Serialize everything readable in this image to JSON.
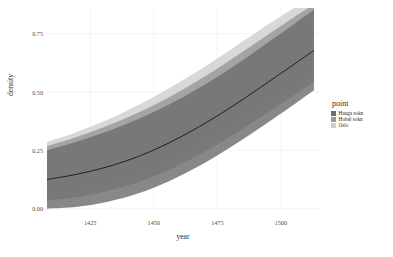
{
  "chart_data": {
    "type": "area",
    "title": "",
    "xlabel": "year",
    "ylabel": "density",
    "xlim": [
      1408,
      1515
    ],
    "ylim": [
      -0.01,
      0.86
    ],
    "xticks": [
      1425,
      1450,
      1475,
      1500
    ],
    "xtick_labels": [
      "1425",
      "1450",
      "1475",
      "1500"
    ],
    "yticks": [
      0.0,
      0.25,
      0.5,
      0.75
    ],
    "ytick_labels": [
      "0.00",
      "0.25",
      "0.50",
      "0.75"
    ],
    "grid": true,
    "grid_color": "#f2f2f2",
    "panel_background": "#ffffff",
    "legend_position": "right",
    "legend_title": "point",
    "series": [
      {
        "name": "Hauga sokn",
        "color": "#6e6e6e",
        "kind": "ribbon-with-median",
        "x": [
          1408,
          1420,
          1432,
          1444,
          1456,
          1468,
          1480,
          1492,
          1504,
          1513
        ],
        "median": [
          0.125,
          0.148,
          0.18,
          0.224,
          0.282,
          0.352,
          0.432,
          0.52,
          0.61,
          0.678
        ],
        "lower": [
          0.0,
          0.008,
          0.03,
          0.066,
          0.118,
          0.184,
          0.262,
          0.348,
          0.438,
          0.508
        ],
        "upper": [
          0.25,
          0.288,
          0.332,
          0.384,
          0.446,
          0.518,
          0.6,
          0.69,
          0.782,
          0.852
        ]
      },
      {
        "name": "Hobøl sokn",
        "color": "#999999",
        "kind": "ribbon",
        "x": [
          1408,
          1420,
          1432,
          1444,
          1456,
          1468,
          1480,
          1492,
          1504,
          1513
        ],
        "median": [
          0.15,
          0.176,
          0.212,
          0.26,
          0.322,
          0.396,
          0.478,
          0.566,
          0.654,
          0.72
        ],
        "lower": [
          0.035,
          0.05,
          0.076,
          0.114,
          0.166,
          0.232,
          0.308,
          0.392,
          0.478,
          0.544
        ],
        "upper": [
          0.268,
          0.308,
          0.356,
          0.412,
          0.478,
          0.552,
          0.636,
          0.724,
          0.812,
          0.876
        ]
      },
      {
        "name": "Oslo",
        "color": "#cfcfcf",
        "kind": "ribbon",
        "x": [
          1408,
          1420,
          1432,
          1444,
          1456,
          1468,
          1480,
          1492,
          1504,
          1513
        ],
        "median": [
          0.172,
          0.202,
          0.244,
          0.298,
          0.364,
          0.442,
          0.528,
          0.618,
          0.704,
          0.768
        ],
        "lower": [
          0.058,
          0.076,
          0.106,
          0.148,
          0.204,
          0.272,
          0.35,
          0.434,
          0.518,
          0.582
        ],
        "upper": [
          0.286,
          0.33,
          0.382,
          0.444,
          0.516,
          0.594,
          0.68,
          0.768,
          0.852,
          0.912
        ]
      }
    ],
    "median_line_color": "#1a1a1a"
  },
  "axes": {
    "x_title": "year",
    "y_title": "density"
  },
  "legend": {
    "title": "point",
    "items": [
      {
        "label": "Hauga sokn",
        "color": "#6e6e6e"
      },
      {
        "label": "Hobøl sokn",
        "color": "#999999"
      },
      {
        "label": "Oslo",
        "color": "#cfcfcf"
      }
    ]
  }
}
